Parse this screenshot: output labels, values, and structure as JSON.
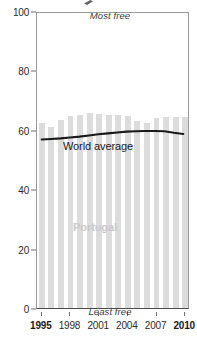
{
  "chart_data": {
    "type": "bar",
    "title": "",
    "subtitle": "",
    "xlabel": "",
    "ylabel": "",
    "ylim": [
      0,
      100
    ],
    "xlim": [
      1994.5,
      2010.5
    ],
    "grid": false,
    "legend_position": "inline-annotation",
    "y_ticks": [
      0,
      20,
      40,
      60,
      80,
      100
    ],
    "y_tick_labels": [
      "0",
      "20",
      "40",
      "60",
      "80",
      "100"
    ],
    "x_ticks": [
      1995,
      1998,
      2001,
      2004,
      2007,
      2010
    ],
    "x_tick_labels": [
      "1995",
      "1998",
      "2001",
      "2004",
      "2007",
      "2010"
    ],
    "x_tick_bold": [
      true,
      false,
      false,
      false,
      false,
      true
    ],
    "categories": [
      1995,
      1996,
      1997,
      1998,
      1999,
      2000,
      2001,
      2002,
      2003,
      2004,
      2005,
      2006,
      2007,
      2008,
      2009,
      2010
    ],
    "series": [
      {
        "name": "Portugal",
        "type": "bar",
        "color": "#dcdcdc",
        "values": [
          62.4,
          61.0,
          63.2,
          64.6,
          65.1,
          65.5,
          65.4,
          65.1,
          64.9,
          64.5,
          63.0,
          62.4,
          64.0,
          64.3,
          64.4,
          64.4
        ]
      },
      {
        "name": "World average",
        "type": "line",
        "color": "#1a1a1a",
        "values": [
          57.1,
          57.3,
          57.5,
          57.8,
          58.1,
          58.5,
          58.9,
          59.2,
          59.5,
          59.8,
          59.9,
          60.0,
          60.0,
          59.9,
          59.4,
          59.0
        ]
      }
    ],
    "annotations": [
      {
        "name": "most-free",
        "text": "Most free",
        "x": 2002.5,
        "y": 97,
        "style": "italic"
      },
      {
        "name": "least-free",
        "text": "Least free",
        "x": 2002.5,
        "y": 2,
        "style": "italic"
      },
      {
        "name": "world-average",
        "text": "World average",
        "x": 1998.5,
        "y": 52,
        "style": "plain"
      },
      {
        "name": "portugal",
        "text": "Portugal",
        "x": 2001.5,
        "y": 27,
        "style": "bold-gray"
      }
    ]
  },
  "labels": {
    "most_free": "Most free",
    "least_free": "Least free",
    "world_average": "World average",
    "country": "Portugal"
  },
  "colors": {
    "bar": "#dcdcdc",
    "line": "#1a1a1a",
    "country_label": "#c9c9c9",
    "axis": "#6f6f6f",
    "frame": "#9a9a9a",
    "background": "#ffffff"
  }
}
